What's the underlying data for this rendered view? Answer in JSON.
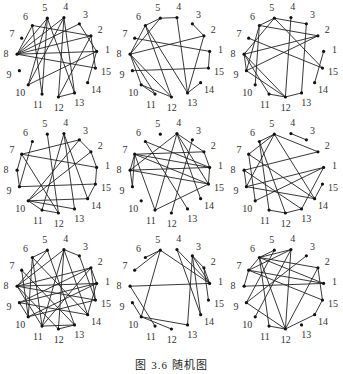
{
  "figure": {
    "caption": "图 3.6   随机图",
    "node_count": 15,
    "node_labels": [
      "1",
      "2",
      "3",
      "4",
      "5",
      "6",
      "7",
      "8",
      "9",
      "10",
      "11",
      "12",
      "13",
      "14",
      "15"
    ]
  },
  "graphs": [
    {
      "name": "graph-1",
      "edges": [
        [
          8,
          5
        ],
        [
          8,
          6
        ],
        [
          8,
          4
        ],
        [
          8,
          2
        ],
        [
          8,
          1
        ],
        [
          8,
          15
        ],
        [
          6,
          11
        ],
        [
          6,
          2
        ],
        [
          5,
          10
        ],
        [
          5,
          13
        ],
        [
          5,
          11
        ],
        [
          4,
          12
        ],
        [
          4,
          13
        ],
        [
          4,
          10
        ],
        [
          3,
          8
        ],
        [
          3,
          1
        ],
        [
          2,
          15
        ],
        [
          2,
          12
        ],
        [
          1,
          14
        ],
        [
          1,
          10
        ],
        [
          12,
          13
        ]
      ]
    },
    {
      "name": "graph-2",
      "edges": [
        [
          8,
          5
        ],
        [
          8,
          6
        ],
        [
          8,
          2
        ],
        [
          8,
          12
        ],
        [
          8,
          11
        ],
        [
          8,
          10
        ],
        [
          6,
          5
        ],
        [
          6,
          12
        ],
        [
          6,
          13
        ],
        [
          5,
          4
        ],
        [
          4,
          13
        ],
        [
          7,
          1
        ],
        [
          3,
          2
        ],
        [
          1,
          15
        ],
        [
          9,
          15
        ],
        [
          2,
          13
        ],
        [
          10,
          12
        ],
        [
          10,
          11
        ],
        [
          14,
          13
        ]
      ]
    },
    {
      "name": "graph-3",
      "edges": [
        [
          6,
          5
        ],
        [
          6,
          2
        ],
        [
          6,
          9
        ],
        [
          6,
          10
        ],
        [
          5,
          8
        ],
        [
          5,
          3
        ],
        [
          5,
          15
        ],
        [
          4,
          12
        ],
        [
          3,
          13
        ],
        [
          8,
          2
        ],
        [
          8,
          9
        ],
        [
          8,
          12
        ],
        [
          8,
          11
        ],
        [
          7,
          15
        ],
        [
          9,
          12
        ],
        [
          9,
          2
        ],
        [
          1,
          14
        ],
        [
          11,
          12
        ],
        [
          12,
          13
        ]
      ]
    },
    {
      "name": "graph-4",
      "edges": [
        [
          7,
          3
        ],
        [
          7,
          1
        ],
        [
          7,
          12
        ],
        [
          7,
          8
        ],
        [
          8,
          9
        ],
        [
          6,
          9
        ],
        [
          5,
          12
        ],
        [
          4,
          14
        ],
        [
          4,
          13
        ],
        [
          4,
          11
        ],
        [
          3,
          2
        ],
        [
          2,
          1
        ],
        [
          1,
          15
        ],
        [
          9,
          15
        ],
        [
          10,
          2
        ],
        [
          10,
          11
        ],
        [
          10,
          13
        ],
        [
          10,
          14
        ],
        [
          11,
          12
        ],
        [
          14,
          15
        ],
        [
          10,
          3
        ]
      ]
    },
    {
      "name": "graph-5",
      "edges": [
        [
          7,
          8
        ],
        [
          7,
          9
        ],
        [
          7,
          2
        ],
        [
          7,
          1
        ],
        [
          7,
          11
        ],
        [
          7,
          15
        ],
        [
          8,
          4
        ],
        [
          8,
          1
        ],
        [
          8,
          15
        ],
        [
          6,
          13
        ],
        [
          6,
          1
        ],
        [
          4,
          11
        ],
        [
          4,
          2
        ],
        [
          4,
          15
        ],
        [
          4,
          14
        ],
        [
          3,
          12
        ],
        [
          2,
          1
        ],
        [
          1,
          15
        ],
        [
          11,
          15
        ],
        [
          9,
          8
        ]
      ]
    },
    {
      "name": "graph-6",
      "edges": [
        [
          6,
          5
        ],
        [
          6,
          12
        ],
        [
          6,
          11
        ],
        [
          5,
          7
        ],
        [
          5,
          9
        ],
        [
          5,
          14
        ],
        [
          5,
          2
        ],
        [
          4,
          3
        ],
        [
          7,
          14
        ],
        [
          8,
          2
        ],
        [
          8,
          13
        ],
        [
          8,
          9
        ],
        [
          9,
          1
        ],
        [
          9,
          14
        ],
        [
          10,
          1
        ],
        [
          1,
          13
        ],
        [
          15,
          14
        ],
        [
          11,
          12
        ],
        [
          12,
          13
        ],
        [
          7,
          10
        ]
      ]
    },
    {
      "name": "graph-7",
      "edges": [
        [
          6,
          5
        ],
        [
          6,
          11
        ],
        [
          6,
          14
        ],
        [
          6,
          10
        ],
        [
          5,
          8
        ],
        [
          5,
          13
        ],
        [
          4,
          8
        ],
        [
          4,
          12
        ],
        [
          4,
          11
        ],
        [
          4,
          14
        ],
        [
          4,
          3
        ],
        [
          3,
          15
        ],
        [
          7,
          10
        ],
        [
          8,
          1
        ],
        [
          8,
          2
        ],
        [
          8,
          11
        ],
        [
          8,
          12
        ],
        [
          8,
          15
        ],
        [
          9,
          2
        ],
        [
          9,
          1
        ],
        [
          9,
          10
        ],
        [
          10,
          15
        ],
        [
          10,
          1
        ],
        [
          11,
          2
        ],
        [
          2,
          1
        ],
        [
          1,
          14
        ],
        [
          2,
          15
        ],
        [
          11,
          13
        ],
        [
          12,
          13
        ],
        [
          9,
          14
        ],
        [
          7,
          13
        ]
      ]
    },
    {
      "name": "graph-8",
      "edges": [
        [
          6,
          5
        ],
        [
          5,
          7
        ],
        [
          5,
          10
        ],
        [
          5,
          1
        ],
        [
          4,
          1
        ],
        [
          4,
          14
        ],
        [
          3,
          2
        ],
        [
          3,
          13
        ],
        [
          3,
          14
        ],
        [
          3,
          1
        ],
        [
          2,
          1
        ],
        [
          2,
          15
        ],
        [
          8,
          1
        ],
        [
          8,
          11
        ],
        [
          9,
          10
        ],
        [
          10,
          12
        ],
        [
          10,
          13
        ]
      ]
    },
    {
      "name": "graph-9",
      "edges": [
        [
          6,
          5
        ],
        [
          6,
          11
        ],
        [
          6,
          12
        ],
        [
          6,
          2
        ],
        [
          6,
          1
        ],
        [
          5,
          9
        ],
        [
          4,
          6
        ],
        [
          4,
          12
        ],
        [
          4,
          10
        ],
        [
          3,
          9
        ],
        [
          7,
          1
        ],
        [
          7,
          15
        ],
        [
          7,
          8
        ],
        [
          7,
          4
        ],
        [
          8,
          1
        ],
        [
          2,
          12
        ],
        [
          2,
          15
        ],
        [
          15,
          14
        ],
        [
          9,
          12
        ],
        [
          12,
          14
        ],
        [
          11,
          12
        ],
        [
          7,
          6
        ]
      ]
    }
  ]
}
